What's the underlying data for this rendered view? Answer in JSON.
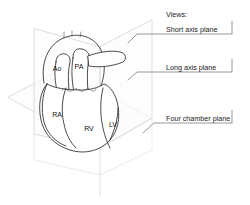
{
  "figure": {
    "background_color": "#ffffff",
    "line_color": "#2b2b2b",
    "plane_color": "#d8d8d8",
    "callout_color": "#8c8c8c",
    "width": 250,
    "height": 205
  },
  "legend": {
    "header": "Views:",
    "items": [
      {
        "label": "Short axis plane",
        "plane": "short-axis"
      },
      {
        "label": "Long axis plane",
        "plane": "long-axis"
      },
      {
        "label": "Four chamber plane",
        "plane": "four-chamber"
      }
    ]
  },
  "anatomy": {
    "title": "Heart with imaging planes",
    "labels": [
      {
        "abbr": "Ao",
        "name": "aorta"
      },
      {
        "abbr": "PA",
        "name": "pulmonary-artery"
      },
      {
        "abbr": "RA",
        "name": "right-atrium"
      },
      {
        "abbr": "RV",
        "name": "right-ventricle"
      },
      {
        "abbr": "LV",
        "name": "left-ventricle"
      }
    ]
  }
}
